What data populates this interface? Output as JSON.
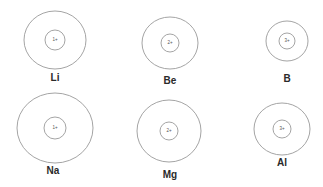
{
  "diagram": {
    "stroke_color": "#9a9a9a",
    "label_color": "#2a2a2a",
    "atoms": [
      {
        "symbol": "Li",
        "charge": "1+",
        "cx": 55,
        "cy": 40,
        "outer_rx": 31,
        "outer_ry": 29,
        "inner_r": 10,
        "label_x": 55,
        "label_y": 78
      },
      {
        "symbol": "Be",
        "charge": "2+",
        "cx": 170,
        "cy": 43,
        "outer_rx": 28,
        "outer_ry": 26,
        "inner_r": 9,
        "label_x": 170,
        "label_y": 81
      },
      {
        "symbol": "B",
        "charge": "3+",
        "cx": 287,
        "cy": 41,
        "outer_rx": 21,
        "outer_ry": 20,
        "inner_r": 8,
        "label_x": 287,
        "label_y": 79
      },
      {
        "symbol": "Na",
        "charge": "1+",
        "cx": 55,
        "cy": 128,
        "outer_rx": 38,
        "outer_ry": 35,
        "inner_r": 11,
        "label_x": 53,
        "label_y": 171
      },
      {
        "symbol": "Mg",
        "charge": "2+",
        "cx": 169,
        "cy": 131,
        "outer_rx": 32,
        "outer_ry": 31,
        "inner_r": 9,
        "label_x": 170,
        "label_y": 175
      },
      {
        "symbol": "Al",
        "charge": "3+",
        "cx": 282,
        "cy": 129,
        "outer_rx": 28,
        "outer_ry": 26,
        "inner_r": 9,
        "label_x": 282,
        "label_y": 163
      }
    ]
  }
}
